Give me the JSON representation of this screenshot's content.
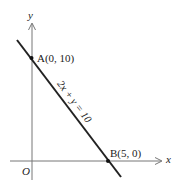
{
  "diagram": {
    "type": "coordinate-plane-line",
    "axes": {
      "x_label": "x",
      "y_label": "y",
      "origin_label": "O"
    },
    "line": {
      "equation_label": "2x + y = 10",
      "color": "#222222"
    },
    "points": [
      {
        "name": "A",
        "label": "A(0, 10)",
        "x": 0,
        "y": 10
      },
      {
        "name": "B",
        "label": "B(5, 0)",
        "x": 5,
        "y": 0
      }
    ]
  }
}
